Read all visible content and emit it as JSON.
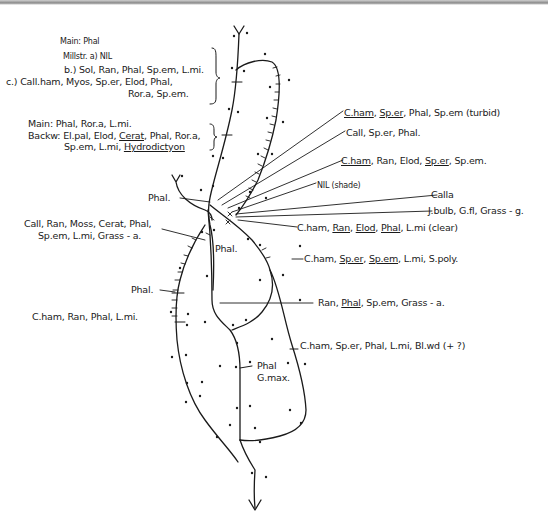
{
  "diagram": {
    "type": "hand-drawn river vegetation sketch map",
    "stroke_color": "#1a1a1a",
    "background": "#ffffff"
  },
  "left_labels": {
    "group1": {
      "main": "Main: Phal",
      "millstr_a": "Millstr. a) NIL",
      "b": "b.) Sol, Ran, Phal, Sp.em, L.mi.",
      "c1": "c.) Call.ham, Myos, Sp.er, Elod, Phal,",
      "c2": "Ror.a, Sp.em."
    },
    "group2": {
      "main": "Main: Phal, Ror.a, L.mi.",
      "backw1": "Backw: El.pal, Elod, ",
      "backw_cerat": "Cerat",
      "backw2": ", Phal, Ror.a,",
      "line3": "Sp.em, L.mi, ",
      "line3_hydro": "Hydrodictyon"
    },
    "phal_top": "Phal.",
    "group3": {
      "line1": "Call, Ran, Moss, Cerat, Phal,",
      "line2": "Sp.em, L.mi, Grass - a."
    },
    "phal_mid": "Phal.",
    "phal_left": "Phal.",
    "group4": "C.ham, Ran, Phal, L.mi.",
    "phal_gmax_1": "Phal",
    "phal_gmax_2": "G.max."
  },
  "right_labels": {
    "r1": {
      "u1": "C.ham",
      "s1": ", ",
      "u2": "Sp.er",
      "rest": ", Phal, Sp.em (turbid)"
    },
    "r2": "Call, Sp.er, Phal.",
    "r3": {
      "u1": "C.ham",
      "mid": ", Ran, Elod, ",
      "u2": "Sp.er",
      "rest": ", Sp.em."
    },
    "r4": "NIL (shade)",
    "r5": "Calla",
    "r6": "J.bulb, G.fl, Grass - g.",
    "r7": {
      "a": "C.ham, ",
      "u1": "Ran",
      "b": ", ",
      "u2": "Elod",
      "c": ", ",
      "u3": "Phal",
      "d": ", L.mi (clear)"
    },
    "r8": {
      "a": "C.ham, ",
      "u1": "Sp.er",
      "b": ", ",
      "u2": "Sp.em",
      "c": ", L.mi, S.poly."
    },
    "r9": {
      "a": "Ran, ",
      "u1": "Phal",
      "b": ", Sp.em, Grass - a."
    },
    "r10": "C.ham, Sp.er, Phal, L.mi, Bl.wd  (+ ?)"
  }
}
